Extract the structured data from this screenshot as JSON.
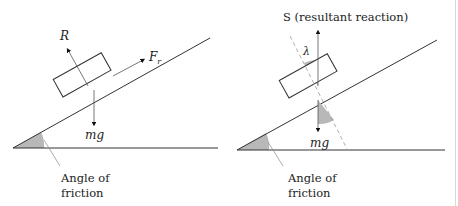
{
  "diagrams": [
    {
      "name": "forces-on-block",
      "labels": {
        "reaction": "R",
        "friction": "F",
        "friction_sub": "r",
        "weight": "mg",
        "angle_line1": "Angle of",
        "angle_line2": "friction"
      }
    },
    {
      "name": "resultant-reaction",
      "labels": {
        "resultant": "S (resultant reaction)",
        "lambda": "λ",
        "weight": "mg",
        "angle_line1": "Angle of",
        "angle_line2": "friction"
      }
    }
  ],
  "colors": {
    "line": "#333333",
    "shade": "#b8b8b8",
    "dashed": "#999999"
  }
}
